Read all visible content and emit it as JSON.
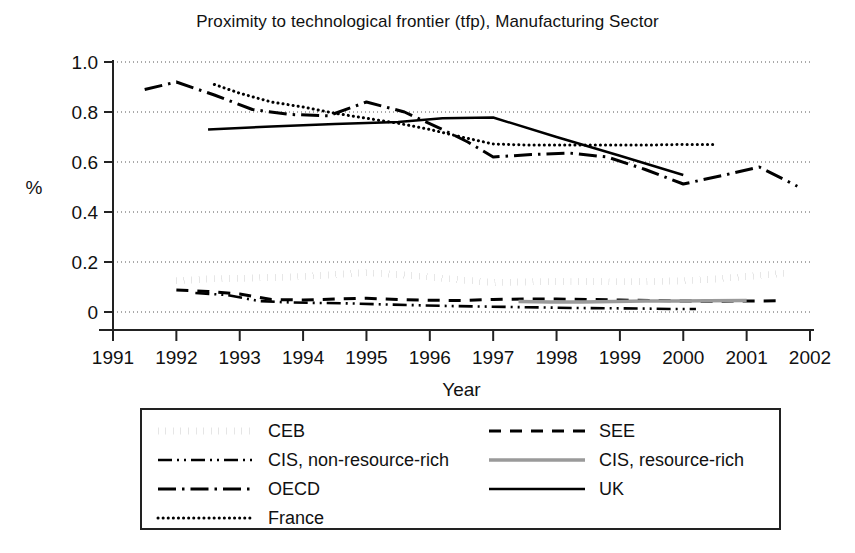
{
  "chart_data": {
    "type": "line",
    "title": "Proximity to technological frontier (tfp), Manufacturing Sector",
    "xlabel": "Year",
    "ylabel": "%",
    "xlim": [
      1991,
      2002
    ],
    "ylim": [
      0,
      1.0
    ],
    "grid": true,
    "legend_position": "below-plot",
    "xticks": [
      "1991",
      "1992",
      "1993",
      "1994",
      "1995",
      "1996",
      "1997",
      "1998",
      "1999",
      "2000",
      "2001",
      "2002"
    ],
    "yticks": [
      "0",
      "0.2",
      "0.4",
      "0.6",
      "0.8",
      "1.0"
    ],
    "ytick_values": [
      0,
      0.2,
      0.4,
      0.6,
      0.8,
      1.0
    ],
    "series": [
      {
        "name": "CEB",
        "style": "thick-dotted",
        "color": "#000000",
        "x": [
          1992.0,
          1992.5,
          1993.0,
          1993.5,
          1994.0,
          1994.5,
          1995.0,
          1995.5,
          1996.0,
          1996.5,
          1997.0,
          1997.5,
          1998.0,
          1998.5,
          1999.0,
          1999.5,
          2000.0,
          2000.5,
          2001.0,
          2001.6
        ],
        "values": [
          0.125,
          0.132,
          0.135,
          0.138,
          0.142,
          0.15,
          0.158,
          0.15,
          0.14,
          0.128,
          0.118,
          0.12,
          0.122,
          0.122,
          0.121,
          0.122,
          0.125,
          0.132,
          0.142,
          0.155
        ]
      },
      {
        "name": "SEE",
        "style": "dashed",
        "color": "#000000",
        "x": [
          1992.0,
          1992.5,
          1993.0,
          1993.5,
          1994.0,
          1994.5,
          1995.0,
          1995.5,
          1996.0,
          1996.5,
          1997.0,
          1997.5,
          1998.0,
          1998.5,
          1999.0,
          1999.5,
          2000.0,
          2000.5,
          2001.0,
          2001.6
        ],
        "values": [
          0.088,
          0.082,
          0.072,
          0.05,
          0.048,
          0.052,
          0.055,
          0.05,
          0.047,
          0.046,
          0.05,
          0.052,
          0.052,
          0.05,
          0.048,
          0.046,
          0.044,
          0.043,
          0.044,
          0.045
        ]
      },
      {
        "name": "CIS, non-resource-rich",
        "style": "dash-dot-dot",
        "color": "#000000",
        "x": [
          1992.3,
          1992.8,
          1993.3,
          1993.8,
          1994.3,
          1994.8,
          1995.3,
          1995.8,
          1996.3,
          1996.8,
          1997.3,
          1997.8,
          1998.3,
          1998.8,
          1999.3,
          1999.8,
          2000.2
        ],
        "values": [
          0.076,
          0.068,
          0.044,
          0.038,
          0.036,
          0.034,
          0.03,
          0.027,
          0.024,
          0.022,
          0.02,
          0.018,
          0.016,
          0.015,
          0.014,
          0.012,
          0.012
        ]
      },
      {
        "name": "CIS, resource-rich",
        "style": "gray-solid",
        "color": "#9a9a9a",
        "x": [
          1997.4,
          1997.9,
          1998.4,
          1998.9,
          1999.4,
          1999.9,
          2000.4,
          2001.0
        ],
        "values": [
          0.042,
          0.04,
          0.04,
          0.042,
          0.044,
          0.044,
          0.045,
          0.046
        ]
      },
      {
        "name": "OECD",
        "style": "dash-dot",
        "color": "#000000",
        "x": [
          1991.5,
          1992.0,
          1992.6,
          1993.2,
          1993.8,
          1994.4,
          1995.0,
          1995.6,
          1996.2,
          1996.6,
          1997.0,
          1997.6,
          1998.2,
          1998.8,
          1999.4,
          2000.0,
          2000.6,
          2001.2,
          2001.8
        ],
        "values": [
          0.89,
          0.92,
          0.868,
          0.81,
          0.79,
          0.785,
          0.84,
          0.8,
          0.73,
          0.68,
          0.62,
          0.63,
          0.636,
          0.62,
          0.57,
          0.512,
          0.545,
          0.58,
          0.503
        ]
      },
      {
        "name": "France",
        "style": "fine-dotted",
        "color": "#000000",
        "x": [
          1992.6,
          1993.0,
          1993.5,
          1994.0,
          1994.5,
          1995.0,
          1995.5,
          1996.0,
          1996.5,
          1997.0,
          1997.5,
          1998.0,
          1998.5,
          1999.0,
          1999.5,
          2000.0,
          2000.5
        ],
        "values": [
          0.91,
          0.875,
          0.84,
          0.82,
          0.795,
          0.775,
          0.755,
          0.73,
          0.7,
          0.672,
          0.668,
          0.668,
          0.668,
          0.668,
          0.668,
          0.67,
          0.67
        ]
      },
      {
        "name": "UK",
        "style": "solid",
        "color": "#000000",
        "x": [
          1992.5,
          1993.5,
          1994.5,
          1995.5,
          1996.2,
          1997.0,
          1998.0,
          1999.0,
          2000.0
        ],
        "values": [
          0.73,
          0.742,
          0.752,
          0.76,
          0.775,
          0.778,
          0.7,
          0.625,
          0.548
        ]
      }
    ]
  },
  "legend": {
    "left": [
      {
        "label": "CEB",
        "style": "thick-dotted"
      },
      {
        "label": "CIS, non-resource-rich",
        "style": "dash-dot-dot"
      },
      {
        "label": "OECD",
        "style": "dash-dot"
      },
      {
        "label": "France",
        "style": "fine-dotted"
      }
    ],
    "right": [
      {
        "label": "SEE",
        "style": "dashed"
      },
      {
        "label": "CIS, resource-rich",
        "style": "gray-solid"
      },
      {
        "label": "UK",
        "style": "solid"
      }
    ]
  }
}
